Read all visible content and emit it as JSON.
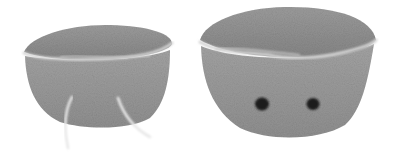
{
  "image": {
    "description": "Two grey crocheted bowl-shaped pieces on a white background; the left piece has two light yarn tails hanging down, the right piece has two black safety eyes.",
    "background_color": "#ffffff",
    "objects": [
      {
        "name": "left-crochet-bowl",
        "color": "#9a9a9a",
        "rim_color": "#d0d0d0",
        "inner_color": "#8e8e8e",
        "details": [
          "two light yarn tails"
        ]
      },
      {
        "name": "right-crochet-bowl",
        "color": "#9a9a9a",
        "rim_color": "#d0d0d0",
        "inner_color": "#8e8e8e",
        "details": [
          "two black safety eyes"
        ]
      }
    ],
    "yarn_tail_color": "#e8e8e8",
    "eye_color": "#1a1a1a"
  }
}
